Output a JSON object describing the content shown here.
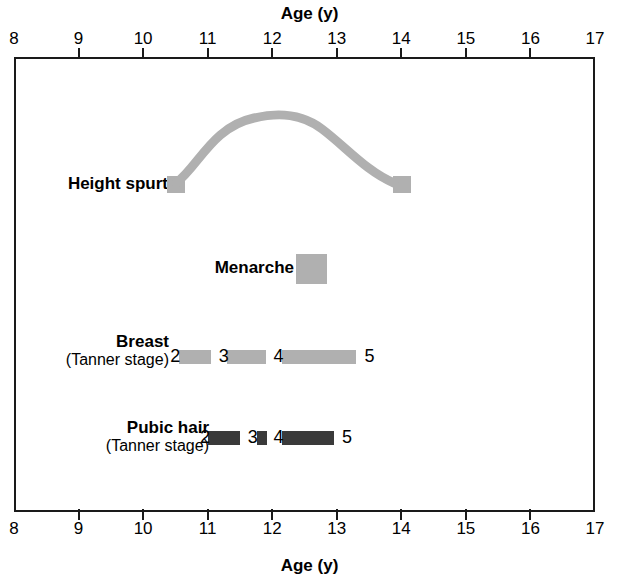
{
  "chart_data": {
    "type": "timeline",
    "title": "Age (y)",
    "xlabel": "Age (y)",
    "ylabel": "",
    "xlim": [
      8,
      17
    ],
    "xticks": [
      8,
      9,
      10,
      11,
      12,
      13,
      14,
      15,
      16,
      17
    ],
    "grid": false,
    "legend": "none",
    "axis_top_label": "Age (y)",
    "axis_bottom_label": "Age (y)",
    "colors": {
      "light_gray": "#b0b0b0",
      "dark_gray": "#3a3a3a",
      "frame": "#1a1a1a",
      "text": "#000000"
    },
    "rows": [
      {
        "name": "height-spurt",
        "label_line1": "Height spurt",
        "label_line2": "",
        "mark_type": "curve-with-endpoint-squares",
        "color": "#b0b0b0",
        "start_age": 10.45,
        "peak_age": 12.2,
        "end_age": 14.0
      },
      {
        "name": "menarche",
        "label_line1": "Menarche",
        "label_line2": "",
        "mark_type": "block",
        "color": "#b0b0b0",
        "start_age": 12.35,
        "end_age": 12.83
      },
      {
        "name": "breast",
        "label_line1": "Breast",
        "label_line2": "(Tanner stage)",
        "mark_type": "segmented-bar",
        "color": "#b0b0b0",
        "start_age": 10.55,
        "end_age": 13.3,
        "stages": [
          {
            "label": "2",
            "age": 10.42
          },
          {
            "label": "3",
            "age": 11.17
          },
          {
            "label": "4",
            "age": 12.02
          },
          {
            "label": "5",
            "age": 13.43
          }
        ],
        "segments": [
          {
            "start_age": 10.55,
            "end_age": 11.05
          },
          {
            "start_age": 11.3,
            "end_age": 11.9
          },
          {
            "start_age": 12.15,
            "end_age": 13.3
          }
        ]
      },
      {
        "name": "pubic-hair",
        "label_line1": "Pubic hair",
        "label_line2": "(Tanner stage)",
        "mark_type": "segmented-bar",
        "color": "#3a3a3a",
        "start_age": 11.0,
        "end_age": 12.95,
        "stages": [
          {
            "label": "2",
            "age": 10.88
          },
          {
            "label": "3",
            "age": 11.62
          },
          {
            "label": "4",
            "age": 12.02
          },
          {
            "label": "5",
            "age": 13.08
          }
        ],
        "segments": [
          {
            "start_age": 11.0,
            "end_age": 11.5
          },
          {
            "start_age": 11.76,
            "end_age": 11.92
          },
          {
            "start_age": 12.15,
            "end_age": 12.95
          }
        ]
      }
    ]
  }
}
